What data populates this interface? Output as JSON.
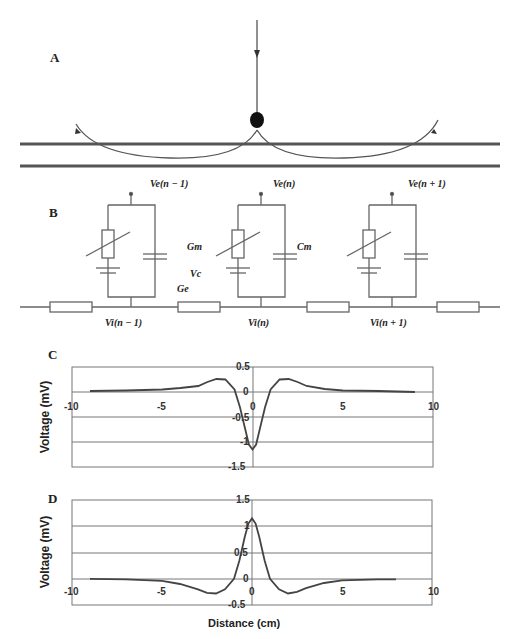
{
  "panels": {
    "a": {
      "label": "A"
    },
    "b": {
      "label": "B",
      "top_labels": [
        "Ve(n − 1)",
        "Ve(n)",
        "Ve(n + 1)"
      ],
      "bottom_labels": [
        "Vi(n − 1)",
        "Vi(n)",
        "Vi(n + 1)"
      ],
      "component_labels": {
        "gm": "Gm",
        "cm": "Cm",
        "vc": "Vc",
        "ge": "Ge"
      }
    },
    "c": {
      "label": "C"
    },
    "d": {
      "label": "D"
    }
  },
  "chart_data": [
    {
      "type": "line",
      "panel": "C",
      "title": "",
      "xlabel": "",
      "ylabel": "Voltage (mV)",
      "xlim": [
        -10,
        10
      ],
      "ylim": [
        -1.5,
        0.5
      ],
      "x_ticks": [
        "-10",
        "-5",
        "0",
        "5",
        "10"
      ],
      "y_ticks": [
        "0.5",
        "0",
        "-0.5",
        "-1",
        "-1.5"
      ],
      "grid": true,
      "series": [
        {
          "name": "extracellular potential",
          "x": [
            -9,
            -7,
            -5,
            -4,
            -3,
            -2.5,
            -2,
            -1.5,
            -1,
            -0.7,
            -0.4,
            -0.2,
            0,
            0.2,
            0.4,
            0.7,
            1,
            1.5,
            2,
            2.5,
            3,
            4,
            5,
            7,
            9
          ],
          "y": [
            0.02,
            0.03,
            0.05,
            0.08,
            0.12,
            0.2,
            0.26,
            0.25,
            0.05,
            -0.3,
            -0.75,
            -1.05,
            -1.15,
            -1.05,
            -0.75,
            -0.3,
            0.05,
            0.25,
            0.26,
            0.2,
            0.12,
            0.06,
            0.03,
            0.02,
            0.0
          ]
        }
      ]
    },
    {
      "type": "line",
      "panel": "D",
      "title": "",
      "xlabel": "Distance (cm)",
      "ylabel": "Voltage (mV)",
      "xlim": [
        -10,
        10
      ],
      "ylim": [
        -0.5,
        1.5
      ],
      "x_ticks": [
        "-10",
        "-5",
        "0",
        "5",
        "10"
      ],
      "y_ticks": [
        "1.5",
        "1",
        "0.5",
        "0",
        "-0.5"
      ],
      "grid": true,
      "series": [
        {
          "name": "intracellular potential",
          "x": [
            -9,
            -7,
            -5,
            -4,
            -3,
            -2.5,
            -2,
            -1.5,
            -1,
            -0.7,
            -0.4,
            -0.2,
            0,
            0.2,
            0.4,
            0.7,
            1,
            1.5,
            2,
            2.5,
            3,
            4,
            5,
            7,
            8
          ],
          "y": [
            0.0,
            -0.01,
            -0.04,
            -0.1,
            -0.2,
            -0.27,
            -0.28,
            -0.2,
            0.0,
            0.35,
            0.8,
            1.05,
            1.15,
            1.05,
            0.8,
            0.35,
            0.0,
            -0.2,
            -0.28,
            -0.25,
            -0.18,
            -0.08,
            -0.03,
            -0.01,
            -0.01
          ]
        }
      ]
    }
  ]
}
